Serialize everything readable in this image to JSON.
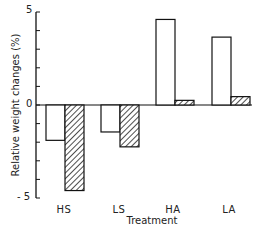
{
  "chart_data": {
    "type": "bar",
    "title": "",
    "xlabel": "Treatment",
    "ylabel": "Relative weight changes (%)",
    "categories": [
      "HS",
      "LS",
      "HA",
      "LA"
    ],
    "series": [
      {
        "name": "open",
        "style": "open",
        "values": [
          -1.9,
          -1.45,
          4.6,
          3.65
        ]
      },
      {
        "name": "hatched",
        "style": "hatched",
        "values": [
          -4.6,
          -2.25,
          0.25,
          0.45
        ]
      }
    ],
    "ylim": [
      -5,
      5
    ],
    "yticks": [
      -5,
      -4,
      -3,
      -2,
      -1,
      0,
      1,
      2,
      3,
      4,
      5
    ],
    "ytick_labels": {
      "5": "5",
      "0": "0",
      "-5": "- 5"
    },
    "grid": false,
    "legend": null
  },
  "labels": {
    "y_top": "5",
    "y_zero": "0",
    "y_bottom": "- 5",
    "x_title": "Treatment",
    "y_title": "Relative weight changes (%)",
    "cats": [
      "HS",
      "LS",
      "HA",
      "LA"
    ]
  },
  "colors": {
    "line": "#111111",
    "open_fill": "#ffffff",
    "hatch": "#222222"
  }
}
